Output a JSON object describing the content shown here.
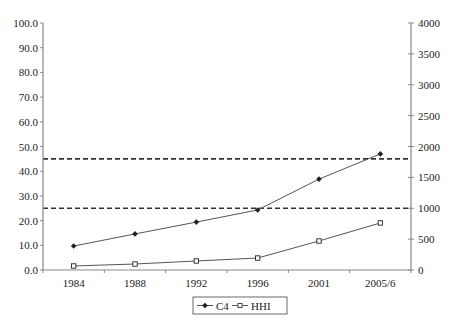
{
  "chart_data": {
    "type": "line",
    "title": "",
    "xlabel": "",
    "ylabel": "",
    "y2label": "",
    "categories": [
      "1984",
      "1988",
      "1992",
      "1996",
      "2001",
      "2005/6"
    ],
    "series": [
      {
        "name": "C4",
        "axis": "left",
        "marker": "filled-diamond",
        "values": [
          9.7,
          14.6,
          19.4,
          24.3,
          36.8,
          47.0
        ]
      },
      {
        "name": "HHI",
        "axis": "right",
        "marker": "hollow-square",
        "values": [
          65,
          97,
          146,
          194,
          470,
          762
        ]
      }
    ],
    "reference_lines": [
      {
        "axis": "right",
        "value": 1800,
        "style": "dashed"
      },
      {
        "axis": "right",
        "value": 1000,
        "style": "dashed"
      }
    ],
    "ylim": [
      0,
      100
    ],
    "y2lim": [
      0,
      4000
    ],
    "yticks": [
      "0.0",
      "10.0",
      "20.0",
      "30.0",
      "40.0",
      "50.0",
      "60.0",
      "70.0",
      "80.0",
      "90.0",
      "100.0"
    ],
    "y2ticks": [
      "0",
      "500",
      "1000",
      "1500",
      "2000",
      "2500",
      "3000",
      "3500",
      "4000"
    ],
    "grid": false,
    "legend_position": "bottom"
  },
  "legend": {
    "items": [
      {
        "label": "C4"
      },
      {
        "label": "HHI"
      }
    ]
  },
  "colors": {
    "line": "#555555",
    "marker": "#222222",
    "axis": "#888888",
    "reference": "#333333"
  }
}
